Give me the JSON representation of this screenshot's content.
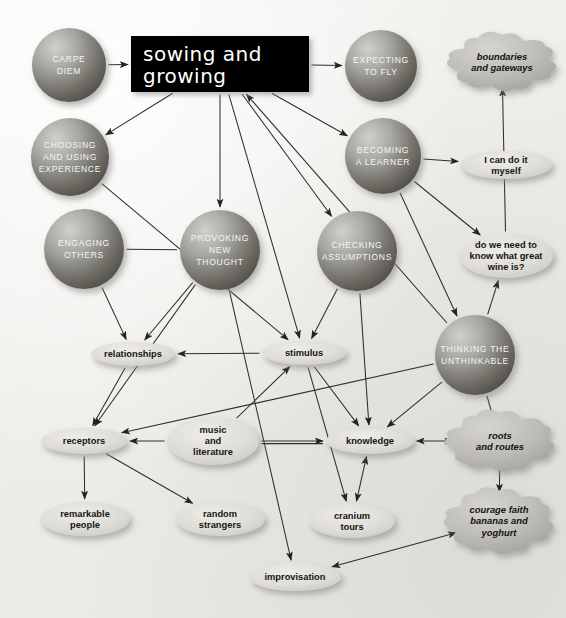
{
  "canvas": {
    "width": 566,
    "height": 618,
    "background": "#f1efec"
  },
  "title": {
    "line1": "sowing  and",
    "line2": "growing",
    "box_color": "#000000",
    "text_color": "#ffffff",
    "x": 131,
    "y": 36,
    "w": 178,
    "h": 56
  },
  "spheres": [
    {
      "id": "carpe-diem",
      "lines": [
        "CARPE",
        "DIEM"
      ],
      "cx": 69,
      "cy": 65,
      "r": 37
    },
    {
      "id": "expecting-to-fly",
      "lines": [
        "EXPECTING",
        "TO FLY"
      ],
      "cx": 381,
      "cy": 66,
      "r": 36
    },
    {
      "id": "choosing-and-using-experience",
      "lines": [
        "CHOOSING",
        "AND USING",
        "EXPERIENCE"
      ],
      "cx": 70,
      "cy": 157,
      "r": 39
    },
    {
      "id": "becoming-a-learner",
      "lines": [
        "BECOMING",
        "A LEARNER"
      ],
      "cx": 383,
      "cy": 156,
      "r": 38
    },
    {
      "id": "engaging-others",
      "lines": [
        "ENGAGING",
        "OTHERS"
      ],
      "cx": 84,
      "cy": 249,
      "r": 40
    },
    {
      "id": "provoking-new-thought",
      "lines": [
        "PROVOKING",
        "NEW",
        "THOUGHT"
      ],
      "cx": 220,
      "cy": 250,
      "r": 40
    },
    {
      "id": "checking-assumptions",
      "lines": [
        "CHECKING",
        "ASSUMPTIONS"
      ],
      "cx": 357,
      "cy": 251,
      "r": 40
    },
    {
      "id": "thinking-the-unthinkable",
      "lines": [
        "THINKING THE",
        "UNTHINKABLE"
      ],
      "cx": 475,
      "cy": 355,
      "r": 40
    }
  ],
  "ellipses": [
    {
      "id": "i-can-do-it-myself",
      "lines": [
        "I can do it",
        "myself"
      ],
      "cx": 506,
      "cy": 165,
      "rx": 46,
      "ry": 14
    },
    {
      "id": "do-we-need-to-know",
      "lines": [
        "do we need to",
        "know what great",
        "wine is?"
      ],
      "cx": 506,
      "cy": 256,
      "rx": 47,
      "ry": 22
    },
    {
      "id": "relationships",
      "lines": [
        "relationships"
      ],
      "cx": 133,
      "cy": 354,
      "rx": 42,
      "ry": 12
    },
    {
      "id": "stimulus",
      "lines": [
        "stimulus"
      ],
      "cx": 304,
      "cy": 353,
      "rx": 42,
      "ry": 12
    },
    {
      "id": "receptors",
      "lines": [
        "receptors"
      ],
      "cx": 84,
      "cy": 441,
      "rx": 43,
      "ry": 13
    },
    {
      "id": "music-and-literature",
      "lines": [
        "music",
        "and",
        "literature"
      ],
      "cx": 213,
      "cy": 441,
      "rx": 46,
      "ry": 24
    },
    {
      "id": "knowledge",
      "lines": [
        "knowledge"
      ],
      "cx": 370,
      "cy": 441,
      "rx": 44,
      "ry": 13
    },
    {
      "id": "remarkable-people",
      "lines": [
        "remarkable",
        "people"
      ],
      "cx": 85,
      "cy": 519,
      "rx": 45,
      "ry": 17
    },
    {
      "id": "random-strangers",
      "lines": [
        "random",
        "strangers"
      ],
      "cx": 220,
      "cy": 519,
      "rx": 45,
      "ry": 17
    },
    {
      "id": "cranium-tours",
      "lines": [
        "cranium",
        "tours"
      ],
      "cx": 352,
      "cy": 521,
      "rx": 43,
      "ry": 17
    },
    {
      "id": "improvisation",
      "lines": [
        "improvisation"
      ],
      "cx": 295,
      "cy": 577,
      "rx": 46,
      "ry": 14
    }
  ],
  "clouds": [
    {
      "id": "boundaries-and-gateways",
      "lines": [
        "boundaries",
        "and gateways"
      ],
      "cx": 502,
      "cy": 62,
      "rx": 48,
      "ry": 25
    },
    {
      "id": "roots-and-routes",
      "lines": [
        "roots",
        "and routes"
      ],
      "cx": 500,
      "cy": 441,
      "rx": 48,
      "ry": 26
    },
    {
      "id": "courage-faith-bananas",
      "lines": [
        "courage faith",
        "bananas and",
        "yoghurt"
      ],
      "cx": 499,
      "cy": 521,
      "rx": 48,
      "ry": 28
    }
  ],
  "edges": [
    {
      "from": "carpe-diem",
      "to": "title",
      "arrow": "end"
    },
    {
      "from": "title",
      "to": "expecting-to-fly",
      "arrow": "end"
    },
    {
      "from": "title",
      "to": "choosing-and-using-experience",
      "arrow": "end"
    },
    {
      "from": "title",
      "to": "provoking-new-thought",
      "arrow": "end"
    },
    {
      "from": "title",
      "to": "becoming-a-learner",
      "arrow": "end"
    },
    {
      "from": "title",
      "to": "checking-assumptions",
      "arrow": "end"
    },
    {
      "from": "title",
      "to": "stimulus",
      "arrow": "end"
    },
    {
      "from": "thinking-the-unthinkable",
      "to": "title",
      "arrow": "end"
    },
    {
      "from": "becoming-a-learner",
      "to": "i-can-do-it-myself",
      "arrow": "end"
    },
    {
      "from": "do-we-need-to-know",
      "to": "boundaries-and-gateways",
      "arrow": "end"
    },
    {
      "from": "becoming-a-learner",
      "to": "do-we-need-to-know",
      "arrow": "end"
    },
    {
      "from": "becoming-a-learner",
      "to": "thinking-the-unthinkable",
      "arrow": "end"
    },
    {
      "from": "thinking-the-unthinkable",
      "to": "do-we-need-to-know",
      "arrow": "end"
    },
    {
      "from": "choosing-and-using-experience",
      "to": "stimulus",
      "arrow": "end"
    },
    {
      "from": "engaging-others",
      "to": "provoking-new-thought",
      "arrow": "none"
    },
    {
      "from": "engaging-others",
      "to": "relationships",
      "arrow": "end"
    },
    {
      "from": "provoking-new-thought",
      "to": "relationships",
      "arrow": "end"
    },
    {
      "from": "provoking-new-thought",
      "to": "receptors",
      "arrow": "end"
    },
    {
      "from": "provoking-new-thought",
      "to": "improvisation",
      "arrow": "end"
    },
    {
      "from": "checking-assumptions",
      "to": "stimulus",
      "arrow": "end"
    },
    {
      "from": "checking-assumptions",
      "to": "knowledge",
      "arrow": "end"
    },
    {
      "from": "stimulus",
      "to": "relationships",
      "arrow": "end"
    },
    {
      "from": "stimulus",
      "to": "knowledge",
      "arrow": "end"
    },
    {
      "from": "relationships",
      "to": "receptors",
      "arrow": "end"
    },
    {
      "from": "music-and-literature",
      "to": "receptors",
      "arrow": "end"
    },
    {
      "from": "music-and-literature",
      "to": "knowledge",
      "arrow": "end"
    },
    {
      "from": "music-and-literature",
      "to": "stimulus",
      "arrow": "end"
    },
    {
      "from": "receptors",
      "to": "remarkable-people",
      "arrow": "end"
    },
    {
      "from": "receptors",
      "to": "random-strangers",
      "arrow": "end"
    },
    {
      "from": "knowledge",
      "to": "cranium-tours",
      "arrow": "both"
    },
    {
      "from": "knowledge",
      "to": "roots-and-routes",
      "arrow": "both"
    },
    {
      "from": "thinking-the-unthinkable",
      "to": "knowledge",
      "arrow": "end"
    },
    {
      "from": "thinking-the-unthinkable",
      "to": "receptors",
      "arrow": "end"
    },
    {
      "from": "thinking-the-unthinkable",
      "to": "roots-and-routes",
      "arrow": "none"
    },
    {
      "from": "roots-and-routes",
      "to": "courage-faith-bananas",
      "arrow": "end"
    },
    {
      "from": "courage-faith-bananas",
      "to": "improvisation",
      "arrow": "both"
    },
    {
      "from": "stimulus",
      "to": "cranium-tours",
      "arrow": "end"
    }
  ],
  "colors": {
    "sphere_light": "#c9c7c2",
    "sphere_dark": "#5e5c58",
    "ellipse_fill": "#dcdad6",
    "cloud_fill": "#b8b6b1",
    "edge": "#2e2e2c",
    "label_dark": "#131310",
    "label_light": "#f3f3f1"
  }
}
